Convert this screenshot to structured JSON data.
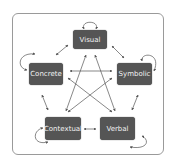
{
  "diagram": {
    "colors": {
      "node_fill": "#555555",
      "node_text": "#f2f2f2",
      "arrow": "#555555",
      "frame": "#9a9a9a"
    },
    "nodes": [
      {
        "id": "visual",
        "label": "Visual"
      },
      {
        "id": "concrete",
        "label": "Concrete"
      },
      {
        "id": "symbolic",
        "label": "Symbolic"
      },
      {
        "id": "contextual",
        "label": "Contextual"
      },
      {
        "id": "verbal",
        "label": "Verbal"
      }
    ],
    "edges": [
      {
        "from": "visual",
        "to": "visual",
        "type": "self-loop"
      },
      {
        "from": "concrete",
        "to": "concrete",
        "type": "self-loop"
      },
      {
        "from": "symbolic",
        "to": "symbolic",
        "type": "self-loop"
      },
      {
        "from": "contextual",
        "to": "contextual",
        "type": "self-loop"
      },
      {
        "from": "verbal",
        "to": "verbal",
        "type": "self-loop"
      },
      {
        "from": "visual",
        "to": "concrete",
        "type": "bidirectional"
      },
      {
        "from": "visual",
        "to": "symbolic",
        "type": "bidirectional"
      },
      {
        "from": "visual",
        "to": "contextual",
        "type": "bidirectional"
      },
      {
        "from": "visual",
        "to": "verbal",
        "type": "bidirectional"
      },
      {
        "from": "concrete",
        "to": "symbolic",
        "type": "bidirectional"
      },
      {
        "from": "concrete",
        "to": "contextual",
        "type": "bidirectional"
      },
      {
        "from": "concrete",
        "to": "verbal",
        "type": "bidirectional"
      },
      {
        "from": "symbolic",
        "to": "contextual",
        "type": "bidirectional"
      },
      {
        "from": "symbolic",
        "to": "verbal",
        "type": "bidirectional"
      },
      {
        "from": "contextual",
        "to": "verbal",
        "type": "bidirectional"
      }
    ]
  }
}
